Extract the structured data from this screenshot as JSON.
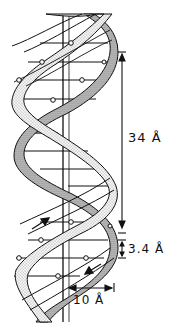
{
  "figure": {
    "labels": {
      "pitch": "34 Å",
      "rise": "3.4 Å",
      "radius": "10 Å"
    },
    "colors": {
      "ink": "#111111",
      "ribbon_fill": "#e6e6e6",
      "background": "#ffffff"
    }
  }
}
